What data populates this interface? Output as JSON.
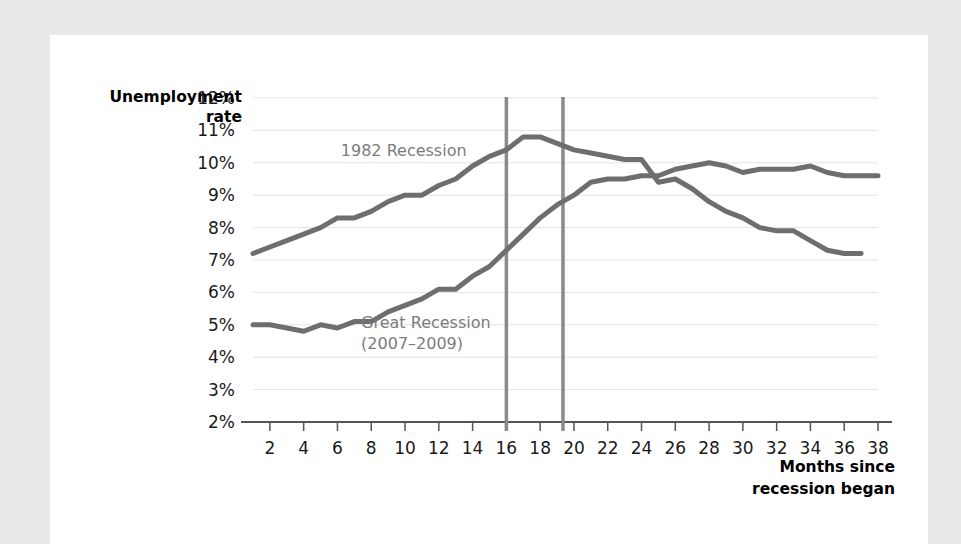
{
  "chart_data": {
    "type": "line",
    "title": "",
    "xlabel": "Months since recession began",
    "ylabel": "Unemployment rate",
    "ylabel_line1": "Unemployment",
    "ylabel_line2": "rate",
    "xlabel_line1": "Months since",
    "xlabel_line2": "recession began",
    "xlim": [
      1,
      38
    ],
    "ylim": [
      2,
      12
    ],
    "ytick_labels": [
      "12%",
      "11%",
      "10%",
      "9%",
      "8%",
      "7%",
      "6%",
      "5%",
      "4%",
      "3%",
      "2%"
    ],
    "ytick_values": [
      12,
      11,
      10,
      9,
      8,
      7,
      6,
      5,
      4,
      3,
      2
    ],
    "xtick_labels": [
      "2",
      "4",
      "6",
      "8",
      "10",
      "12",
      "14",
      "16",
      "18",
      "20",
      "22",
      "24",
      "26",
      "28",
      "30",
      "32",
      "34",
      "36",
      "38"
    ],
    "xtick_values": [
      2,
      4,
      6,
      8,
      10,
      12,
      14,
      16,
      18,
      20,
      22,
      24,
      26,
      28,
      30,
      32,
      34,
      36,
      38
    ],
    "grid": true,
    "legend_position": "inline-annotations",
    "line_color": "#6e6e6e",
    "marker_line_color": "#8a8a8a",
    "annotations": [
      {
        "name": "1982-recession-label",
        "text": "1982 Recession",
        "x": 6.2,
        "y": 10.35
      },
      {
        "name": "great-recession-label-line1",
        "text": "Great Recession",
        "x": 7.4,
        "y": 5.05
      },
      {
        "name": "great-recession-label-line2",
        "text": "(2007–2009)",
        "x": 7.4,
        "y": 4.42
      }
    ],
    "vertical_markers": [
      {
        "name": "marker-month-16",
        "x": 16,
        "label": "16"
      },
      {
        "name": "marker-month-19",
        "x": 19.35,
        "label": "19"
      }
    ],
    "series": [
      {
        "name": "1982 Recession",
        "color": "#6e6e6e",
        "x": [
          1,
          2,
          3,
          4,
          5,
          6,
          7,
          8,
          9,
          10,
          11,
          12,
          13,
          14,
          15,
          16,
          17,
          18,
          19,
          20,
          21,
          22,
          23,
          24,
          25,
          26,
          27,
          28,
          29,
          30,
          31,
          32,
          33,
          34,
          35,
          36,
          37
        ],
        "values": [
          7.2,
          7.4,
          7.6,
          7.8,
          8.0,
          8.3,
          8.3,
          8.5,
          8.8,
          9.0,
          9.0,
          9.3,
          9.5,
          9.9,
          10.2,
          10.4,
          10.8,
          10.8,
          10.6,
          10.4,
          10.3,
          10.2,
          10.1,
          10.1,
          9.4,
          9.5,
          9.2,
          8.8,
          8.5,
          8.3,
          8.0,
          7.9,
          7.9,
          7.6,
          7.3,
          7.2,
          7.2
        ]
      },
      {
        "name": "Great Recession (2007–2009)",
        "color": "#6e6e6e",
        "x": [
          1,
          2,
          3,
          4,
          5,
          6,
          7,
          8,
          9,
          10,
          11,
          12,
          13,
          14,
          15,
          16,
          17,
          18,
          19,
          20,
          21,
          22,
          23,
          24,
          25,
          26,
          27,
          28,
          29,
          30,
          31,
          32,
          33,
          34,
          35,
          36,
          37,
          38
        ],
        "values": [
          5.0,
          5.0,
          4.9,
          4.8,
          5.0,
          4.9,
          5.1,
          5.1,
          5.4,
          5.6,
          5.8,
          6.1,
          6.1,
          6.5,
          6.8,
          7.3,
          7.8,
          8.3,
          8.7,
          9.0,
          9.4,
          9.5,
          9.5,
          9.6,
          9.6,
          9.8,
          9.9,
          10.0,
          9.9,
          9.7,
          9.8,
          9.8,
          9.8,
          9.9,
          9.7,
          9.6,
          9.6,
          9.6
        ]
      }
    ]
  }
}
